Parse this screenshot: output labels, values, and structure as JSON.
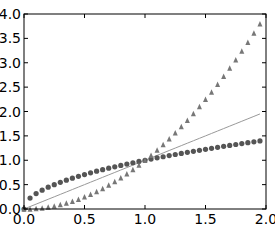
{
  "chart_data": {
    "type": "scatter",
    "title": "",
    "xlabel": "",
    "ylabel": "",
    "xlim": [
      0.0,
      2.0
    ],
    "ylim": [
      0.0,
      4.0
    ],
    "grid": false,
    "legend": null,
    "x_ticks": [
      "0.0",
      "0.5",
      "1.0",
      "1.5",
      "2.0"
    ],
    "y_ticks": [
      "0.0",
      "0.5",
      "1.0",
      "1.5",
      "2.0",
      "2.5",
      "3.0",
      "3.5",
      "4.0"
    ],
    "x": [
      0.0,
      0.05,
      0.1,
      0.15,
      0.2,
      0.25,
      0.3,
      0.35,
      0.4,
      0.45,
      0.5,
      0.55,
      0.6,
      0.65,
      0.7,
      0.75,
      0.8,
      0.85,
      0.9,
      0.95,
      1.0,
      1.05,
      1.1,
      1.15,
      1.2,
      1.25,
      1.3,
      1.35,
      1.4,
      1.45,
      1.5,
      1.55,
      1.6,
      1.65,
      1.7,
      1.75,
      1.8,
      1.85,
      1.9,
      1.95
    ],
    "series": [
      {
        "name": "linear (t)",
        "style": "line",
        "color": "#999999",
        "values": [
          0.0,
          0.05,
          0.1,
          0.15,
          0.2,
          0.25,
          0.3,
          0.35,
          0.4,
          0.45,
          0.5,
          0.55,
          0.6,
          0.65,
          0.7,
          0.75,
          0.8,
          0.85,
          0.9,
          0.95,
          1.0,
          1.05,
          1.1,
          1.15,
          1.2,
          1.25,
          1.3,
          1.35,
          1.4,
          1.45,
          1.5,
          1.55,
          1.6,
          1.65,
          1.7,
          1.75,
          1.8,
          1.85,
          1.9,
          1.95
        ]
      },
      {
        "name": "sqrt (t^0.5)",
        "style": "circle-markers",
        "color": "#555555",
        "values": [
          0.0,
          0.224,
          0.316,
          0.387,
          0.447,
          0.5,
          0.548,
          0.592,
          0.632,
          0.671,
          0.707,
          0.742,
          0.775,
          0.806,
          0.837,
          0.866,
          0.894,
          0.922,
          0.949,
          0.975,
          1.0,
          1.025,
          1.049,
          1.072,
          1.095,
          1.118,
          1.14,
          1.162,
          1.183,
          1.204,
          1.225,
          1.245,
          1.265,
          1.285,
          1.304,
          1.323,
          1.342,
          1.36,
          1.378,
          1.396
        ]
      },
      {
        "name": "square (t^2)",
        "style": "triangle-markers",
        "color": "#777777",
        "values": [
          0.0,
          0.0025,
          0.01,
          0.0225,
          0.04,
          0.0625,
          0.09,
          0.1225,
          0.16,
          0.2025,
          0.25,
          0.3025,
          0.36,
          0.4225,
          0.49,
          0.5625,
          0.64,
          0.7225,
          0.81,
          0.9025,
          1.0,
          1.1025,
          1.21,
          1.3225,
          1.44,
          1.5625,
          1.69,
          1.8225,
          1.96,
          2.1025,
          2.25,
          2.4025,
          2.56,
          2.7225,
          2.89,
          3.0625,
          3.24,
          3.4225,
          3.61,
          3.8025
        ]
      }
    ]
  }
}
